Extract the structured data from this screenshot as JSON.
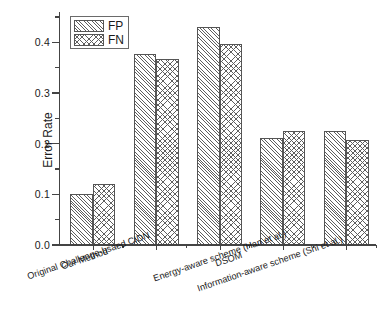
{
  "chart_data": {
    "type": "bar",
    "title": "",
    "xlabel": "",
    "ylabel": "Error Rate",
    "ylim": [
      0.0,
      0.46
    ],
    "yticks": [
      "0.0",
      "0.1",
      "0.2",
      "0.3",
      "0.4"
    ],
    "ytick_values": [
      0.0,
      0.1,
      0.2,
      0.3,
      0.4
    ],
    "yminor_step": 0.05,
    "grid": false,
    "legend_position": "upper-left",
    "categories": [
      "Our Method",
      "Original Challenge-bsaed CIDN",
      "DSOM",
      "Energy-aware scheme (Han et al.)",
      "Information-aware scheme (Shi et al.)"
    ],
    "series": [
      {
        "name": "FP",
        "pattern": "diagonal-hatch",
        "values": [
          0.101,
          0.378,
          0.43,
          0.212,
          0.226
        ]
      },
      {
        "name": "FN",
        "pattern": "cross-hatch",
        "values": [
          0.12,
          0.368,
          0.397,
          0.226,
          0.208
        ]
      }
    ]
  },
  "legend": {
    "items": [
      {
        "label": "FP"
      },
      {
        "label": "FN"
      }
    ]
  },
  "colors": {
    "axis": "#444444",
    "hatch": "#5e5e5e",
    "bar_edge": "#555555",
    "text": "#1a1a1a",
    "background": "#ffffff"
  }
}
